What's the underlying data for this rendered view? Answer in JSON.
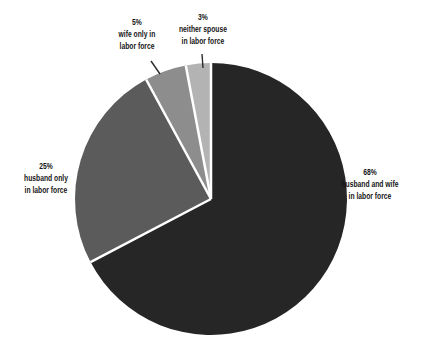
{
  "figure": {
    "background": "#ffffff",
    "text_color": "#151515",
    "leader_line_color": "#2a2a2a"
  },
  "chart_data": {
    "type": "pie",
    "title": "",
    "legend_position": "none",
    "labels_on_chart": true,
    "start_angle_deg": 0,
    "direction": "clockwise",
    "separator_color": "#ffffff",
    "slices": [
      {
        "id": "husband-and-wife",
        "label": "husband and wife in labor force",
        "pct_label": "68%",
        "value": 68,
        "color": "#262626"
      },
      {
        "id": "husband-only",
        "label": "husband only in labor force",
        "pct_label": "25%",
        "value": 25,
        "color": "#5b5b5b"
      },
      {
        "id": "wife-only",
        "label": "wife only in labor force",
        "pct_label": "5%",
        "value": 5,
        "color": "#8d8d8d"
      },
      {
        "id": "neither-spouse",
        "label": "neither spouse in labor force",
        "pct_label": "3%",
        "value": 3,
        "color": "#b3b3b3"
      }
    ]
  },
  "labels": {
    "husband_wife": {
      "pct": "68%",
      "line1": "husband and wife",
      "line2": "in labor force"
    },
    "husband_only": {
      "pct": "25%",
      "line1": "husband only",
      "line2": "in labor force"
    },
    "wife_only": {
      "pct": "5%",
      "line1": "wife only in",
      "line2": "labor force"
    },
    "neither": {
      "pct": "3%",
      "line1": "neither spouse",
      "line2": "in labor force"
    }
  }
}
